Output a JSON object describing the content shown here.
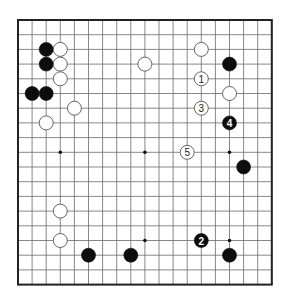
{
  "board": {
    "size": 19,
    "origin_x": 18,
    "origin_y": 20,
    "step_x": 14.1,
    "step_y": 14.7,
    "stone_radius": 7,
    "colors": {
      "background": "#ffffff",
      "line": "#6a6a6a",
      "border": "#222222",
      "black_stone": "#0d0d0d",
      "white_stone": "#ffffff"
    },
    "star_points": [
      [
        3,
        3
      ],
      [
        9,
        3
      ],
      [
        15,
        3
      ],
      [
        3,
        9
      ],
      [
        9,
        9
      ],
      [
        15,
        9
      ],
      [
        3,
        15
      ],
      [
        9,
        15
      ],
      [
        15,
        15
      ]
    ],
    "stones": [
      {
        "color": "black",
        "col": 2,
        "row": 2,
        "label": ""
      },
      {
        "color": "white",
        "col": 3,
        "row": 2,
        "label": ""
      },
      {
        "color": "black",
        "col": 2,
        "row": 3,
        "label": ""
      },
      {
        "color": "white",
        "col": 3,
        "row": 3,
        "label": ""
      },
      {
        "color": "white",
        "col": 3,
        "row": 4,
        "label": ""
      },
      {
        "color": "black",
        "col": 1,
        "row": 5,
        "label": ""
      },
      {
        "color": "black",
        "col": 2,
        "row": 5,
        "label": ""
      },
      {
        "color": "white",
        "col": 4,
        "row": 6,
        "label": ""
      },
      {
        "color": "white",
        "col": 2,
        "row": 7,
        "label": ""
      },
      {
        "color": "white",
        "col": 9,
        "row": 3,
        "label": ""
      },
      {
        "color": "white",
        "col": 13,
        "row": 2,
        "label": ""
      },
      {
        "color": "black",
        "col": 15,
        "row": 3,
        "label": ""
      },
      {
        "color": "white",
        "col": 13,
        "row": 4,
        "label": "1"
      },
      {
        "color": "white",
        "col": 15,
        "row": 5,
        "label": ""
      },
      {
        "color": "white",
        "col": 13,
        "row": 6,
        "label": "3"
      },
      {
        "color": "black",
        "col": 15,
        "row": 7,
        "label": "4"
      },
      {
        "color": "white",
        "col": 12,
        "row": 9,
        "label": "5"
      },
      {
        "color": "black",
        "col": 16,
        "row": 10,
        "label": ""
      },
      {
        "color": "white",
        "col": 3,
        "row": 13,
        "label": ""
      },
      {
        "color": "white",
        "col": 3,
        "row": 15,
        "label": ""
      },
      {
        "color": "black",
        "col": 5,
        "row": 16,
        "label": ""
      },
      {
        "color": "black",
        "col": 8,
        "row": 16,
        "label": ""
      },
      {
        "color": "black",
        "col": 13,
        "row": 15,
        "label": "2"
      },
      {
        "color": "black",
        "col": 15,
        "row": 16,
        "label": ""
      }
    ]
  }
}
